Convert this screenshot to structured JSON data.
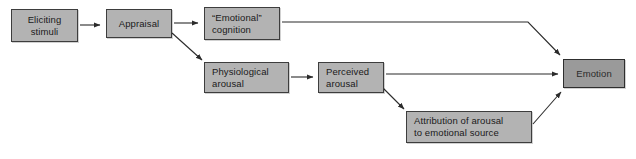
{
  "diagram": {
    "colors": {
      "node_fill": "#b3b3b3",
      "node_fill_emphasis": "#9a9a9a",
      "node_border": "#3d3d3d",
      "edge": "#2b2b2b",
      "background": "#ffffff",
      "text": "#1a1a1a"
    },
    "nodes": [
      {
        "id": "eliciting-stimuli",
        "lines": [
          "Eliciting",
          "stimuli"
        ],
        "align": "center"
      },
      {
        "id": "appraisal",
        "lines": [
          "Appraisal"
        ],
        "align": "center"
      },
      {
        "id": "emotional-cognition",
        "lines": [
          "“Emotional”",
          "cognition"
        ],
        "align": "left"
      },
      {
        "id": "physiological-arousal",
        "lines": [
          "Physiological",
          "arousal"
        ],
        "align": "left"
      },
      {
        "id": "perceived-arousal",
        "lines": [
          "Perceived",
          "arousal"
        ],
        "align": "left"
      },
      {
        "id": "attribution",
        "lines": [
          "Attribution of arousal",
          "to emotional source"
        ],
        "align": "left"
      },
      {
        "id": "emotion",
        "lines": [
          "Emotion"
        ],
        "align": "center",
        "emphasis": true
      }
    ],
    "edges": [
      {
        "id": "eliciting-to-appraisal",
        "from": "eliciting-stimuli",
        "to": "appraisal",
        "kind": "straight-arrow"
      },
      {
        "id": "appraisal-to-emotional-cognition",
        "from": "appraisal",
        "to": "emotional-cognition",
        "kind": "straight-arrow"
      },
      {
        "id": "appraisal-to-physiological-arousal",
        "from": "appraisal",
        "to": "physiological-arousal",
        "kind": "diagonal-arrow"
      },
      {
        "id": "physiological-to-perceived-arousal",
        "from": "physiological-arousal",
        "to": "perceived-arousal",
        "kind": "straight-arrow"
      },
      {
        "id": "emotional-cognition-to-emotion",
        "from": "emotional-cognition",
        "to": "emotion",
        "kind": "elbow-arrow"
      },
      {
        "id": "perceived-arousal-to-emotion",
        "from": "perceived-arousal",
        "to": "emotion",
        "kind": "straight-arrow"
      },
      {
        "id": "perceived-arousal-to-attribution",
        "from": "perceived-arousal",
        "to": "attribution",
        "kind": "diagonal-arrow"
      },
      {
        "id": "attribution-to-emotion",
        "from": "attribution",
        "to": "emotion",
        "kind": "diagonal-arrow"
      }
    ]
  }
}
